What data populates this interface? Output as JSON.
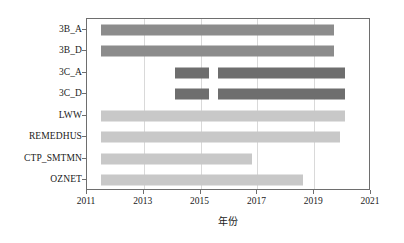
{
  "chart_data": {
    "type": "bar",
    "orientation": "horizontal",
    "subtype": "gantt-timeline",
    "title": "",
    "xlabel": "年份",
    "ylabel": "",
    "xlim": [
      2011,
      2021
    ],
    "ylim": [
      0,
      8
    ],
    "grid": "vertical",
    "legend": "none",
    "xticks": [
      2011,
      2013,
      2015,
      2017,
      2019,
      2021
    ],
    "xtick_labels": [
      "2011",
      "2013",
      "2015",
      "2017",
      "2019",
      "2021"
    ],
    "categories": [
      "3B_A",
      "3B_D",
      "3C_A",
      "3C_D",
      "LWW",
      "REMEDHUS",
      "CTP_SMTMN",
      "OZNET"
    ],
    "colors": {
      "group_3b": "#8c8c8c",
      "group_3c": "#6e6e6e",
      "group_network": "#c8c8c8",
      "axis": "#6e6e6e",
      "grid": "#d9d9d9",
      "background": "#ffffff"
    },
    "bars": [
      {
        "category": "3B_A",
        "color": "#8c8c8c",
        "segments": [
          {
            "start": 2011.5,
            "end": 2019.7
          }
        ]
      },
      {
        "category": "3B_D",
        "color": "#8c8c8c",
        "segments": [
          {
            "start": 2011.5,
            "end": 2019.7
          }
        ]
      },
      {
        "category": "3C_A",
        "color": "#6e6e6e",
        "segments": [
          {
            "start": 2014.1,
            "end": 2015.3
          },
          {
            "start": 2015.6,
            "end": 2020.1
          }
        ]
      },
      {
        "category": "3C_D",
        "color": "#6e6e6e",
        "segments": [
          {
            "start": 2014.1,
            "end": 2015.3
          },
          {
            "start": 2015.6,
            "end": 2020.1
          }
        ]
      },
      {
        "category": "LWW",
        "color": "#c8c8c8",
        "segments": [
          {
            "start": 2011.5,
            "end": 2020.1
          }
        ]
      },
      {
        "category": "REMEDHUS",
        "color": "#c8c8c8",
        "segments": [
          {
            "start": 2011.5,
            "end": 2019.9
          }
        ]
      },
      {
        "category": "CTP_SMTMN",
        "color": "#c8c8c8",
        "segments": [
          {
            "start": 2011.5,
            "end": 2016.8
          }
        ]
      },
      {
        "category": "OZNET",
        "color": "#c8c8c8",
        "segments": [
          {
            "start": 2011.5,
            "end": 2018.6
          }
        ]
      }
    ]
  }
}
